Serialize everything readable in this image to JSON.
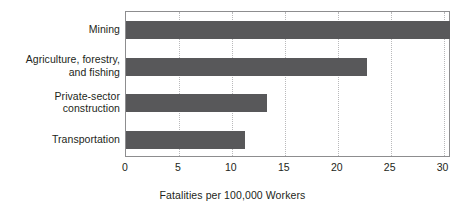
{
  "chart_data": {
    "type": "bar",
    "orientation": "horizontal",
    "title": "",
    "xlabel": "Fatalities per 100,000 Workers",
    "ylabel": "",
    "categories": [
      "Mining",
      "Agriculture, forestry, and fishing",
      "Private-sector construction",
      "Transportation"
    ],
    "category_lines": [
      [
        "Mining"
      ],
      [
        "Agriculture, forestry,",
        "and fishing"
      ],
      [
        "Private-sector",
        "construction"
      ],
      [
        "Transportation"
      ]
    ],
    "values": [
      30.6,
      22.8,
      13.3,
      11.2
    ],
    "xlim": [
      0,
      30.7
    ],
    "xticks": [
      0,
      5,
      10,
      15,
      20,
      25,
      30
    ],
    "xtick_labels": [
      "0",
      "5",
      "10",
      "15",
      "20",
      "25",
      "30"
    ],
    "grid": true,
    "grid_axis": "x",
    "legend": false,
    "bar_color": "#58585a",
    "plot_border_color": "#8d8d8f",
    "gridline_color": "#b9b9bb",
    "background_color": "#ffffff"
  }
}
